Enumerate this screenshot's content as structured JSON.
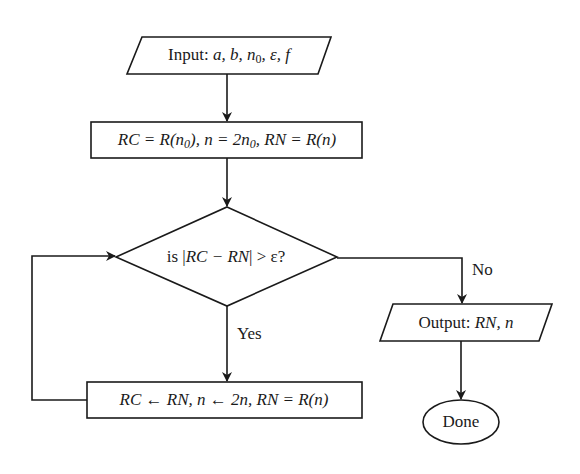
{
  "diagram": {
    "type": "flowchart",
    "colors": {
      "stroke": "#1a1a1a",
      "background": "#ffffff",
      "text": "#1a1a1a"
    },
    "nodes": {
      "input": {
        "shape": "parallelogram",
        "prefix": "Input:",
        "vars": "a, b, n",
        "sub": "0",
        "rest": ", ε, f"
      },
      "init": {
        "shape": "rectangle",
        "p1": "RC = R(n",
        "s1": "0",
        "p2": "), n = 2n",
        "s2": "0",
        "p3": ", RN = R(n)"
      },
      "decision": {
        "shape": "diamond",
        "prefix": "is |",
        "expr": "RC − RN",
        "suffix": "| > ε?"
      },
      "update": {
        "shape": "rectangle",
        "text": "RC ← RN, n ← 2n, RN = R(n)"
      },
      "output": {
        "shape": "parallelogram",
        "prefix": "Output:",
        "vars": "RN, n"
      },
      "done": {
        "shape": "ellipse",
        "text": "Done"
      }
    },
    "edges": {
      "yes_label": "Yes",
      "no_label": "No"
    }
  }
}
